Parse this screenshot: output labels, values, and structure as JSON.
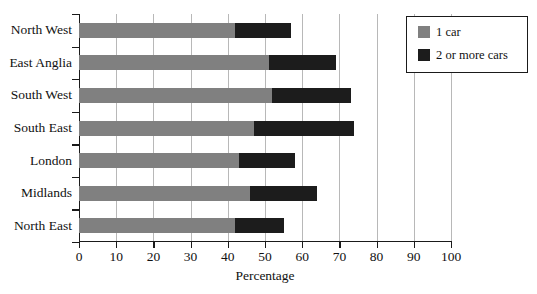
{
  "chart_data": {
    "type": "bar",
    "orientation": "horizontal",
    "stacked": true,
    "title": "",
    "xlabel": "Percentage",
    "ylabel": "",
    "xlim": [
      0,
      100
    ],
    "xticks": [
      0,
      10,
      20,
      30,
      40,
      50,
      60,
      70,
      80,
      90,
      100
    ],
    "grid": "vertical",
    "legend_position": "top-right",
    "categories": [
      "North West",
      "East Anglia",
      "South West",
      "South East",
      "London",
      "Midlands",
      "North East"
    ],
    "series": [
      {
        "name": "1 car",
        "color": "#808080",
        "values": [
          42,
          51,
          52,
          47,
          43,
          46,
          42
        ]
      },
      {
        "name": "2 or more cars",
        "color": "#1c1c1c",
        "values": [
          15,
          18,
          21,
          27,
          15,
          18,
          13
        ]
      }
    ],
    "cumulative_totals": [
      57,
      69,
      73,
      74,
      58,
      64,
      55
    ]
  },
  "legend": {
    "items": [
      {
        "label": "1 car",
        "color": "#808080"
      },
      {
        "label": "2 or more cars",
        "color": "#1c1c1c"
      }
    ]
  },
  "axis": {
    "x_title": "Percentage",
    "x_tick_labels": [
      "0",
      "10",
      "20",
      "30",
      "40",
      "50",
      "60",
      "70",
      "80",
      "90",
      "100"
    ]
  }
}
